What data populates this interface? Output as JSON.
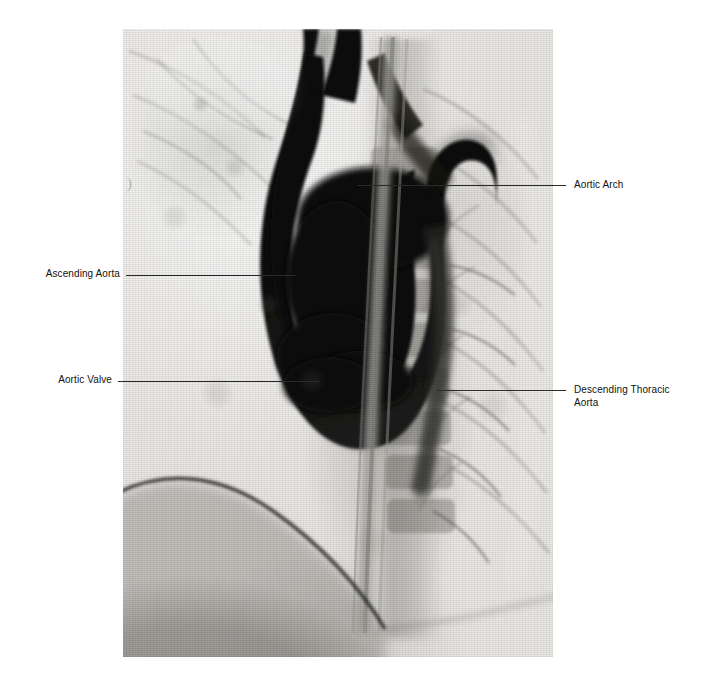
{
  "figure": {
    "type": "aortogram",
    "modality": "digital subtraction angiography",
    "width": 701,
    "height": 683,
    "background_color": "#ffffff"
  },
  "radiograph": {
    "left": 123,
    "top": 29,
    "width": 430,
    "height": 628,
    "film_tint": "#efeeec",
    "contrast_color": "#111111",
    "date_stamp": "2005-23",
    "corner_mark": ")"
  },
  "annotations": [
    {
      "id": "ascending-aorta",
      "label": "Ascending Aorta",
      "side": "left",
      "text_x": 28,
      "text_y": 267,
      "line_x": 126,
      "line_y": 275,
      "line_length": 170
    },
    {
      "id": "aortic-valve",
      "label": "Aortic Valve",
      "side": "left",
      "text_x": 50,
      "text_y": 373,
      "line_x": 118,
      "line_y": 381,
      "line_length": 202
    },
    {
      "id": "aortic-arch",
      "label": "Aortic Arch",
      "side": "right",
      "text_x": 574,
      "text_y": 178,
      "line_x": 357,
      "line_y": 185,
      "line_length": 209
    },
    {
      "id": "descending-thoracic-aorta",
      "label": "Descending Thoracic\nAorta",
      "side": "right",
      "text_x": 574,
      "text_y": 383,
      "line_x": 437,
      "line_y": 390,
      "line_length": 129
    }
  ],
  "anatomy": {
    "aorta_opacity_color": "#141414",
    "catheter_color": "#9a9892",
    "structures": [
      "ascending aorta",
      "aortic arch",
      "descending thoracic aorta",
      "aortic valve",
      "brachiocephalic trunk",
      "left common carotid artery",
      "left subclavian artery",
      "pigtail catheter",
      "thoracic vertebrae",
      "diaphragm"
    ]
  }
}
